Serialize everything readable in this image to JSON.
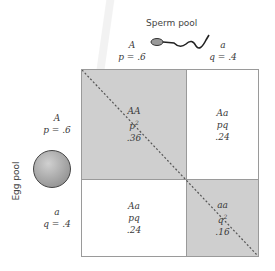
{
  "sperm_pool": {
    "title": "Sperm pool",
    "allele_A": "A",
    "freq_A": "p = .6",
    "allele_a": "a",
    "freq_a": "q = .4"
  },
  "egg_pool": {
    "title": "Egg pool",
    "allele_A": "A",
    "freq_A": "p = .6",
    "allele_a": "a",
    "freq_a": "q = .4"
  },
  "punnett": {
    "cells": [
      {
        "genotype": "AA",
        "expr": "p",
        "exp_sup": "2",
        "value": ".36",
        "shaded": true
      },
      {
        "genotype": "Aa",
        "expr": "pq",
        "exp_sup": "",
        "value": ".24",
        "shaded": false
      },
      {
        "genotype": "Aa",
        "expr": "pq",
        "exp_sup": "",
        "value": ".24",
        "shaded": false
      },
      {
        "genotype": "aa",
        "expr": "q",
        "exp_sup": "2",
        "value": ".16",
        "shaded": true
      }
    ]
  },
  "colors": {
    "shaded": "#cfcfcf",
    "border": "#9a9a9a",
    "diagonal": "#555555",
    "egg": "#a8a8a8"
  }
}
